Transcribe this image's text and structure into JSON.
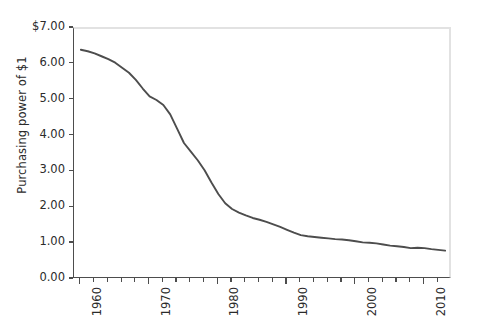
{
  "chart_data": {
    "type": "line",
    "title": "",
    "xlabel": "",
    "ylabel": "Purchasing power of $1",
    "xlim": [
      1959,
      2014
    ],
    "ylim": [
      0.0,
      7.0
    ],
    "grid": false,
    "legend": null,
    "line_color": "#4d4d4d",
    "x": [
      1960,
      1961,
      1962,
      1963,
      1964,
      1965,
      1966,
      1967,
      1968,
      1969,
      1970,
      1971,
      1972,
      1973,
      1974,
      1975,
      1976,
      1977,
      1978,
      1979,
      1980,
      1981,
      1982,
      1983,
      1984,
      1985,
      1986,
      1987,
      1988,
      1989,
      1990,
      1991,
      1992,
      1993,
      1994,
      1995,
      1996,
      1997,
      1998,
      1999,
      2000,
      2001,
      2002,
      2003,
      2004,
      2005,
      2006,
      2007,
      2008,
      2009,
      2010,
      2011,
      2012,
      2013
    ],
    "y": [
      6.42,
      6.38,
      6.32,
      6.24,
      6.16,
      6.06,
      5.92,
      5.78,
      5.58,
      5.34,
      5.12,
      5.02,
      4.88,
      4.62,
      4.22,
      3.82,
      3.58,
      3.34,
      3.06,
      2.72,
      2.4,
      2.14,
      1.98,
      1.88,
      1.8,
      1.73,
      1.68,
      1.62,
      1.55,
      1.48,
      1.4,
      1.32,
      1.25,
      1.22,
      1.2,
      1.18,
      1.16,
      1.14,
      1.13,
      1.11,
      1.08,
      1.05,
      1.04,
      1.02,
      0.99,
      0.96,
      0.94,
      0.92,
      0.89,
      0.9,
      0.89,
      0.86,
      0.84,
      0.82
    ],
    "y_ticks": [
      0.0,
      1.0,
      2.0,
      3.0,
      4.0,
      5.0,
      6.0,
      7.0
    ],
    "y_tick_labels": [
      "0.00",
      "1.00",
      "2.00",
      "3.00",
      "4.00",
      "5.00",
      "6.00",
      "$7.00"
    ],
    "x_major_ticks": [
      1960,
      1970,
      1980,
      1990,
      2000,
      2010
    ],
    "x_major_labels": [
      "1960",
      "1970",
      "1980",
      "1990",
      "2000",
      "2010"
    ],
    "x_minor_ticks": [
      1962,
      1964,
      1966,
      1968,
      1972,
      1974,
      1976,
      1978,
      1982,
      1984,
      1986,
      1988,
      1992,
      1994,
      1996,
      1998,
      2002,
      2004,
      2006,
      2008,
      2012
    ]
  }
}
